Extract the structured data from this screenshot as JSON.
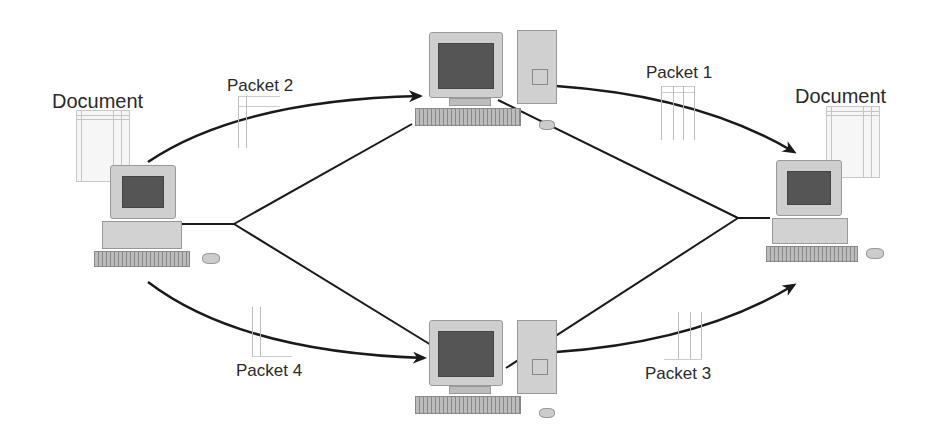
{
  "diagram": {
    "type": "packet-switching-network",
    "nodes": {
      "sender": {
        "label": "Document",
        "kind": "desktop-pc"
      },
      "router_top": {
        "kind": "tower-pc"
      },
      "router_bottom": {
        "kind": "tower-pc"
      },
      "receiver": {
        "label": "Document",
        "kind": "desktop-pc"
      }
    },
    "packets": [
      {
        "id": "packet-2",
        "label": "Packet 2",
        "path": "sender → router_top"
      },
      {
        "id": "packet-1",
        "label": "Packet 1",
        "path": "router_top → receiver"
      },
      {
        "id": "packet-4",
        "label": "Packet 4",
        "path": "sender → router_bottom"
      },
      {
        "id": "packet-3",
        "label": "Packet 3",
        "path": "router_bottom → receiver"
      }
    ],
    "links": [
      {
        "from": "sender",
        "to": "router_top"
      },
      {
        "from": "sender",
        "to": "router_bottom"
      },
      {
        "from": "router_top",
        "to": "receiver"
      },
      {
        "from": "router_bottom",
        "to": "receiver"
      }
    ],
    "colors": {
      "line": "#1a1a1a",
      "text": "#2a2a2a",
      "background": "#ffffff"
    }
  },
  "labels": {
    "doc_left": "Document",
    "doc_right": "Document",
    "packet1": "Packet 1",
    "packet2": "Packet 2",
    "packet3": "Packet 3",
    "packet4": "Packet 4"
  }
}
